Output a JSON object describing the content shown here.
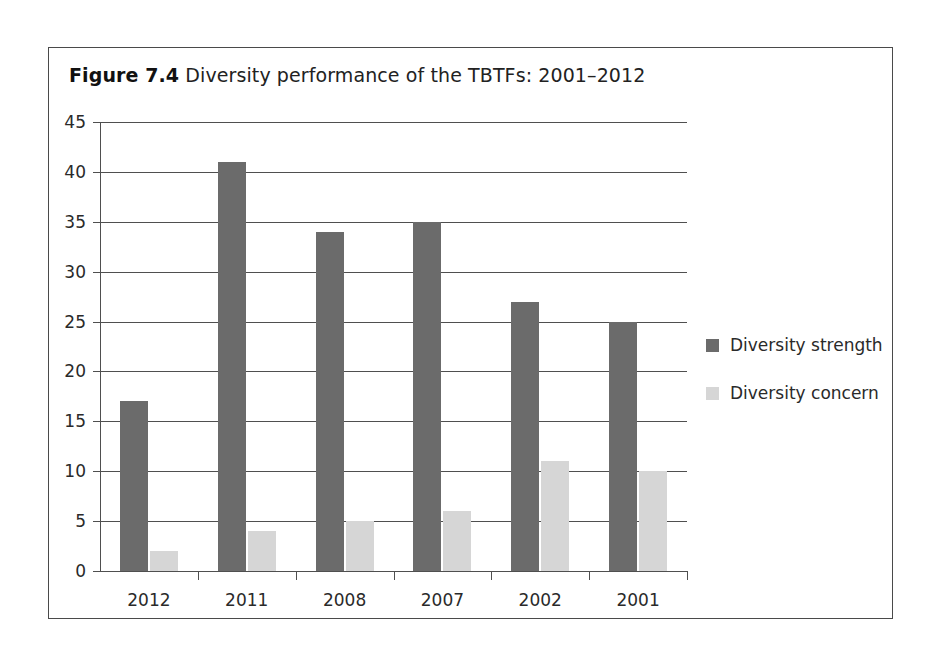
{
  "figure": {
    "caption_label": "Figure 7.4",
    "caption_text": "Diversity performance of the TBTFs: 2001–2012"
  },
  "colors": {
    "strength": "#6b6b6b",
    "concern": "#d6d6d6",
    "axis": "#4f4f4f",
    "frame": "#4a4a4a",
    "text": "#2a2a2a"
  },
  "chart_data": {
    "type": "bar",
    "title": "Figure 7.4  Diversity performance of the TBTFs: 2001–2012",
    "categories": [
      "2012",
      "2011",
      "2008",
      "2007",
      "2002",
      "2001"
    ],
    "series": [
      {
        "name": "Diversity strength",
        "values": [
          17,
          41,
          34,
          35,
          27,
          25
        ],
        "color": "#6b6b6b"
      },
      {
        "name": "Diversity concern",
        "values": [
          2,
          4,
          5,
          6,
          11,
          10
        ],
        "color": "#d6d6d6"
      }
    ],
    "xlabel": "",
    "ylabel": "",
    "ylim": [
      0,
      45
    ],
    "yticks": [
      0,
      5,
      10,
      15,
      20,
      25,
      30,
      35,
      40,
      45
    ],
    "ytick_labels": [
      "0",
      "5",
      "10",
      "15",
      "20",
      "25",
      "30",
      "35",
      "40",
      "45"
    ],
    "grid": "horizontal",
    "legend_position": "right"
  }
}
